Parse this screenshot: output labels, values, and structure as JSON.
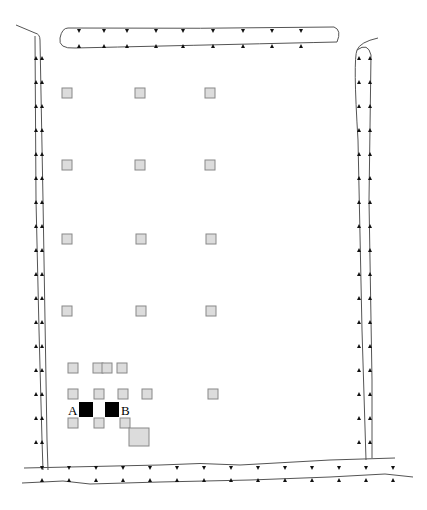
{
  "diagram": {
    "labels": {
      "a": "A",
      "b": "B"
    },
    "colors": {
      "line": "#555555",
      "square_fill": "#dcdcdc",
      "square_stroke": "#888888",
      "marked": "#000000"
    },
    "grid_squares": [
      [
        62,
        88
      ],
      [
        135,
        88
      ],
      [
        205,
        88
      ],
      [
        62,
        160
      ],
      [
        135,
        160
      ],
      [
        205,
        160
      ],
      [
        62,
        234
      ],
      [
        136,
        234
      ],
      [
        206,
        234
      ],
      [
        62,
        306
      ],
      [
        136,
        306
      ],
      [
        206,
        306
      ],
      [
        68,
        363
      ],
      [
        93,
        363
      ],
      [
        102,
        363
      ],
      [
        117,
        363
      ],
      [
        68,
        389
      ],
      [
        94,
        389
      ],
      [
        118,
        389
      ],
      [
        142,
        389
      ],
      [
        208,
        389
      ],
      [
        68,
        418
      ],
      [
        94,
        418
      ],
      [
        120,
        418
      ]
    ],
    "large_square": [
      129,
      428,
      20,
      18
    ],
    "black_squares": [
      [
        79,
        402,
        14,
        15
      ],
      [
        105,
        402,
        14,
        15
      ]
    ]
  }
}
